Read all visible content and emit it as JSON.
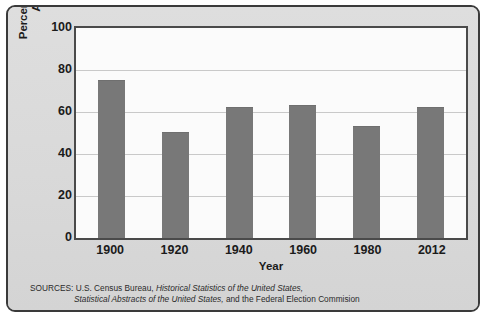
{
  "figure": {
    "y_axis_title_line1": "Percentage of Population",
    "y_axis_title_line2": "Actually Voting",
    "x_axis_title": "Year",
    "source_prefix": "SOURCES: U.S. Census Bureau, ",
    "source_italic_1": "Historical Statistics of the United States,",
    "source_italic_2": "Statistical Abstracts of the United States,",
    "source_suffix": " and the Federal Election Commision",
    "colors": {
      "bar": "#787878",
      "panel_background": "#dcdcdc",
      "plot_background": "#fbfbfb",
      "frame_border": "#3a3a3a",
      "axis_border": "#4a4a4a",
      "gridline": "#c9c9c9",
      "text": "#1b1b1b"
    }
  },
  "chart_data": {
    "type": "bar",
    "title": "",
    "xlabel": "Year",
    "ylabel": "Percentage of Population Actually Voting",
    "categories": [
      "1900",
      "1920",
      "1940",
      "1960",
      "1980",
      "2012"
    ],
    "values": [
      75,
      50,
      62,
      63,
      53,
      62
    ],
    "ylim": [
      0,
      100
    ],
    "yticks": [
      0,
      20,
      40,
      60,
      80,
      100
    ],
    "ytick_labels": [
      "0",
      "20",
      "40",
      "60",
      "80",
      "100"
    ],
    "grid": true,
    "legend": false,
    "series": [
      {
        "name": "Percentage of Population Actually Voting",
        "values": [
          75,
          50,
          62,
          63,
          53,
          62
        ],
        "color": "#787878"
      }
    ]
  }
}
